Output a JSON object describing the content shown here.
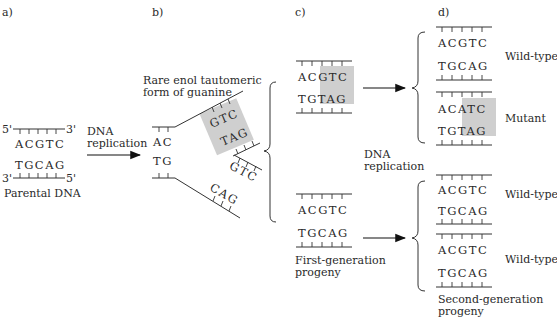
{
  "panels": {
    "a": "a)",
    "b": "b)",
    "c": "c)",
    "d": "d)"
  },
  "panel_a": {
    "top_strand": {
      "five_prime": "5'",
      "three_prime": "3'",
      "bases": "ACGTC"
    },
    "bottom_strand": {
      "three_prime": "3'",
      "five_prime": "5'",
      "bases": "TGCAG"
    },
    "caption": "Parental DNA"
  },
  "arrow_ab": {
    "line1": "DNA",
    "line2": "replication"
  },
  "panel_b": {
    "caption_line1": "Rare enol tautomeric",
    "caption_line2": "form of guanine",
    "fork_top_left": "AC",
    "fork_bottom_left": "TG",
    "upper_arm_template": "GTC",
    "upper_arm_new": "TAG",
    "lower_arm_new": "GTC",
    "lower_arm_template": "CAG"
  },
  "panel_c": {
    "top_duplex": {
      "top": [
        "A",
        "C",
        "G",
        "T",
        "C"
      ],
      "bottom": [
        "T",
        "G",
        "T",
        "A",
        "G"
      ],
      "highlight_from": 2
    },
    "bottom_duplex": {
      "top": [
        "A",
        "C",
        "G",
        "T",
        "C"
      ],
      "bottom": [
        "T",
        "G",
        "C",
        "A",
        "G"
      ]
    },
    "replication_label_line1": "DNA",
    "replication_label_line2": "replication",
    "caption_line1": "First-generation",
    "caption_line2": "progeny"
  },
  "panel_d": {
    "duplexes": [
      {
        "top": "ACGTC",
        "bottom": "TGCAG",
        "label": "Wild-type"
      },
      {
        "top": "ACATC",
        "bottom": "TGTAG",
        "label": "Mutant",
        "highlight_from": 2
      },
      {
        "top": "ACGTC",
        "bottom": "TGCAG",
        "label": "Wild-type"
      },
      {
        "top": "ACGTC",
        "bottom": "TGCAG",
        "label": "Wild-type"
      }
    ],
    "caption_line1": "Second-generation",
    "caption_line2": "progeny"
  },
  "colors": {
    "ink": "#2a2a2a",
    "highlight": "#cfcfcf",
    "background": "#ffffff"
  }
}
